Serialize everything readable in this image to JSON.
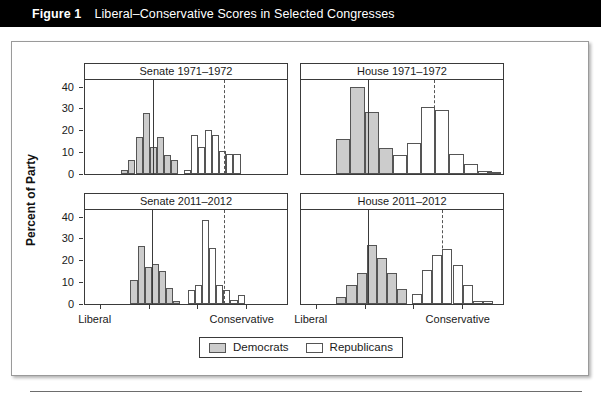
{
  "caption": {
    "label": "Figure 1",
    "text": "Liberal–Conservative Scores in Selected Congresses"
  },
  "legend": {
    "entries": [
      {
        "label": "Democrats",
        "color": "#cccccc",
        "name": "democrats"
      },
      {
        "label": "Republicans",
        "color": "#ffffff",
        "name": "republicans"
      }
    ]
  },
  "axes": {
    "ylabel": "Percent of Party",
    "yticks_top": [
      "40",
      "30",
      "20",
      "10",
      "0"
    ],
    "yticks_bottom": [
      "40",
      "30",
      "20",
      "10",
      "0"
    ],
    "xlabel_left": "Liberal",
    "xlabel_right": "Conservative",
    "ylim": [
      0,
      43
    ]
  },
  "chart_data": {
    "type": "bar",
    "title": "Liberal–Conservative Scores in Selected Congresses",
    "xlabel": "Liberal–Conservative score",
    "ylabel": "Percent of Party",
    "ylim": [
      0,
      43
    ],
    "grid": false,
    "legend_position": "bottom-center",
    "layout": "2x2 small multiples (histograms)",
    "panels": [
      {
        "title": "Senate 1971–1972",
        "row": 0,
        "col": 0,
        "yticks": [
          0,
          10,
          20,
          30,
          40
        ],
        "median_democrat_x": 0.335,
        "median_republican_x": 0.69,
        "series": [
          {
            "name": "Democrats",
            "fill": "#cccccc",
            "bins_x": [
              0.18,
              0.215,
              0.25,
              0.285,
              0.32,
              0.355,
              0.39,
              0.425
            ],
            "bin_width": 0.035,
            "values": [
              2,
              6.5,
              17,
              28,
              12.5,
              17,
              8.5,
              6.5
            ]
          },
          {
            "name": "Republicans",
            "fill": "#ffffff",
            "bins_x": [
              0.49,
              0.525,
              0.56,
              0.595,
              0.63,
              0.665,
              0.7,
              0.735
            ],
            "bin_width": 0.035,
            "values": [
              2,
              18,
              12.5,
              20,
              18,
              10.5,
              9,
              9
            ]
          }
        ]
      },
      {
        "title": "House 1971–1972",
        "row": 0,
        "col": 1,
        "yticks": [
          0,
          10,
          20,
          30,
          40
        ],
        "median_democrat_x": 0.33,
        "median_republican_x": 0.66,
        "series": [
          {
            "name": "Democrats",
            "fill": "#cccccc",
            "bins_x": [
              0.175,
              0.245,
              0.315,
              0.385
            ],
            "bin_width": 0.07,
            "values": [
              16,
              40,
              28.5,
              12
            ]
          },
          {
            "name": "Republicans",
            "fill": "#ffffff",
            "bins_x": [
              0.455,
              0.525,
              0.595,
              0.665,
              0.735,
              0.805,
              0.875,
              0.92
            ],
            "bin_width": 0.07,
            "values": [
              8.5,
              14,
              30.5,
              29.5,
              9,
              4.5,
              1.5,
              0.5
            ]
          }
        ]
      },
      {
        "title": "Senate 2011–2012",
        "row": 1,
        "col": 0,
        "yticks": [
          0,
          10,
          20,
          30,
          40
        ],
        "median_democrat_x": 0.33,
        "median_republican_x": 0.69,
        "series": [
          {
            "name": "Democrats",
            "fill": "#cccccc",
            "bins_x": [
              0.225,
              0.26,
              0.295,
              0.33,
              0.365,
              0.4,
              0.435
            ],
            "bin_width": 0.035,
            "values": [
              11,
              26.5,
              17,
              18.5,
              15,
              7.5,
              1.5
            ]
          },
          {
            "name": "Republicans",
            "fill": "#ffffff",
            "bins_x": [
              0.51,
              0.545,
              0.58,
              0.615,
              0.65,
              0.685,
              0.72,
              0.755,
              0.79
            ],
            "bin_width": 0.035,
            "values": [
              6.5,
              8.5,
              38.5,
              25.5,
              8.5,
              6.5,
              2,
              4
            ]
          }
        ]
      },
      {
        "title": "House 2011–2012",
        "row": 1,
        "col": 1,
        "yticks": [
          0,
          10,
          20,
          30,
          40
        ],
        "median_democrat_x": 0.33,
        "median_republican_x": 0.7,
        "series": [
          {
            "name": "Democrats",
            "fill": "#cccccc",
            "bins_x": [
              0.175,
              0.225,
              0.275,
              0.325,
              0.375,
              0.425,
              0.475
            ],
            "bin_width": 0.05,
            "values": [
              3,
              8.5,
              14,
              27,
              21,
              14,
              7
            ]
          },
          {
            "name": "Republicans",
            "fill": "#ffffff",
            "bins_x": [
              0.55,
              0.6,
              0.65,
              0.7,
              0.75,
              0.8,
              0.85,
              0.9
            ],
            "bin_width": 0.05,
            "values": [
              4.5,
              15.5,
              22.5,
              25,
              18,
              8.5,
              1.5,
              1.5
            ]
          }
        ]
      }
    ]
  }
}
